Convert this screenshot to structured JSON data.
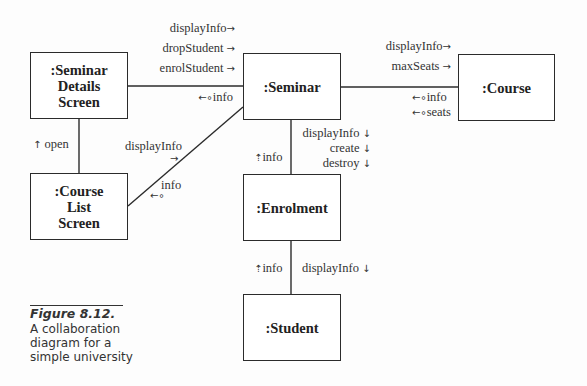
{
  "objects": {
    "seminar_details_screen": ":Seminar\nDetails\nScreen",
    "seminar": ":Seminar",
    "course": ":Course",
    "course_list_screen": ":Course\nList\nScreen",
    "enrolment": ":Enrolment",
    "student": ":Student"
  },
  "messages": {
    "sds_to_seminar": [
      "displayInfo",
      "dropStudent",
      "enrolStudent"
    ],
    "seminar_to_sds_return": "info",
    "seminar_to_course": [
      "displayInfo",
      "maxSeats"
    ],
    "course_to_seminar_return": [
      "info",
      "seats"
    ],
    "sds_to_cls": "open",
    "cls_to_seminar": "displayInfo",
    "seminar_to_cls_return": "info",
    "seminar_to_enrolment": [
      "displayInfo",
      "create",
      "destroy"
    ],
    "enrolment_to_seminar_return": "info",
    "enrolment_to_student": "displayInfo",
    "student_to_enrolment_return": "info"
  },
  "arrows": {
    "right": "→",
    "down": "↓",
    "up": "↑",
    "return_left": "←∘",
    "return_up": "⇡"
  },
  "caption": {
    "title": "Figure 8.12.",
    "lines": [
      "A collaboration",
      "diagram for a",
      "simple university"
    ]
  }
}
